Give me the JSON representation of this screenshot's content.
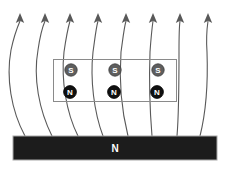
{
  "figure": {
    "background_color": "#ffffff",
    "width": 230,
    "height": 169
  },
  "diagram_data": {
    "type": "diagram",
    "description": "Magnetic field lines rising from a bar magnet with a row of dipole pole pairs above it",
    "colors": {
      "field_line": "#595959",
      "coil_box_stroke": "#8a8a8a",
      "magnet_fill": "#1c1c1c",
      "magnet_stroke": "#a8a8a8",
      "south_pole_fill": "#5e5e5e",
      "north_pole_fill": "#101010",
      "label_text": "#ffffff"
    },
    "magnet_bar": {
      "label": "N",
      "x": 13,
      "y": 136,
      "width": 204,
      "height": 24
    },
    "coil_box": {
      "x": 53,
      "y": 59,
      "width": 124,
      "height": 43
    },
    "poles": [
      {
        "label": "S",
        "type": "south",
        "cx": 71,
        "cy": 70
      },
      {
        "label": "S",
        "type": "south",
        "cx": 115,
        "cy": 70
      },
      {
        "label": "S",
        "type": "south",
        "cx": 158,
        "cy": 70
      },
      {
        "label": "N",
        "type": "north",
        "cx": 70,
        "cy": 92
      },
      {
        "label": "N",
        "type": "north",
        "cx": 114,
        "cy": 92
      },
      {
        "label": "N",
        "type": "north",
        "cx": 157,
        "cy": 92
      }
    ],
    "field_lines": [
      {
        "id": 1,
        "base_x": 25,
        "base_y": 136,
        "tip_x": 20,
        "tip_y": 14,
        "direction": "up"
      },
      {
        "id": 2,
        "base_x": 52,
        "base_y": 136,
        "tip_x": 45,
        "tip_y": 14,
        "direction": "up"
      },
      {
        "id": 3,
        "base_x": 78,
        "base_y": 136,
        "tip_x": 70,
        "tip_y": 14,
        "direction": "up"
      },
      {
        "id": 4,
        "base_x": 103,
        "base_y": 136,
        "tip_x": 98,
        "tip_y": 14,
        "direction": "up"
      },
      {
        "id": 5,
        "base_x": 128,
        "base_y": 136,
        "tip_x": 126,
        "tip_y": 14,
        "direction": "up"
      },
      {
        "id": 6,
        "base_x": 152,
        "base_y": 136,
        "tip_x": 153,
        "tip_y": 14,
        "direction": "up"
      },
      {
        "id": 7,
        "base_x": 177,
        "base_y": 136,
        "tip_x": 180,
        "tip_y": 14,
        "direction": "up"
      },
      {
        "id": 8,
        "base_x": 200,
        "base_y": 136,
        "tip_x": 208,
        "tip_y": 14,
        "direction": "up"
      }
    ],
    "arrow_count": 8
  }
}
